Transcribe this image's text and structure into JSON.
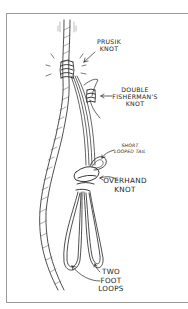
{
  "diagram": {
    "labels": {
      "prusik": [
        "PRUSIK",
        "KNOT"
      ],
      "double_fisherman": [
        "DOUBLE",
        "FISHERMAN'S",
        "KNOT"
      ],
      "short_tail": [
        "SHORT",
        "LOOPED TAIL"
      ],
      "overhand": [
        "OVERHAND",
        "KNOT"
      ],
      "foot_loops": [
        "TWO",
        "FOOT",
        "LOOPS"
      ]
    },
    "colors": {
      "ink": "#222222",
      "frame": "#9a9a9a",
      "background": "#ffffff"
    }
  }
}
